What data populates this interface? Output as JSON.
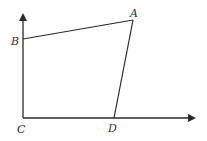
{
  "diagram": {
    "type": "quadrilateral-on-axes",
    "stroke_color": "#2a2a2a",
    "background": "#ffffff",
    "points": {
      "A": {
        "label": "A",
        "x": 133,
        "y": 20
      },
      "B": {
        "label": "B",
        "x": 23,
        "y": 39
      },
      "C": {
        "label": "C",
        "x": 23,
        "y": 118
      },
      "D": {
        "label": "D",
        "x": 114,
        "y": 118
      }
    },
    "axes": {
      "y_axis": {
        "from": [
          23,
          118
        ],
        "to": [
          23,
          13
        ],
        "arrow": true
      },
      "x_axis": {
        "from": [
          23,
          118
        ],
        "to": [
          196,
          118
        ],
        "arrow": true
      }
    },
    "segments": [
      [
        "B",
        "A"
      ],
      [
        "A",
        "D"
      ]
    ]
  }
}
